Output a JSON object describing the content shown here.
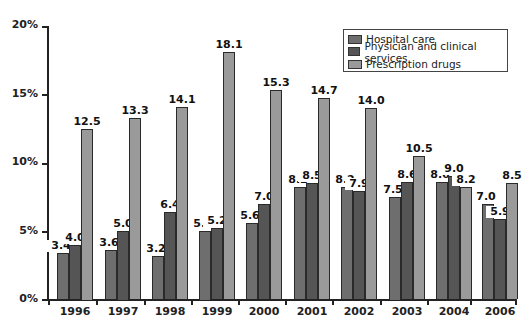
{
  "chart_data": {
    "type": "bar",
    "title": "",
    "xlabel": "",
    "ylabel": "",
    "ylim": [
      0,
      20
    ],
    "yticks": [
      "0%",
      "5%",
      "10%",
      "15%",
      "20%"
    ],
    "grid": false,
    "legend_position": "top-right",
    "categories": [
      "1996",
      "1997",
      "1998",
      "1999",
      "2000",
      "2001",
      "2002",
      "2003",
      "2004",
      "2006"
    ],
    "series": [
      {
        "name": "Hospital care",
        "color": "#6e6e6e",
        "values": [
          3.4,
          3.6,
          3.2,
          5.0,
          5.6,
          8.2,
          8.2,
          7.5,
          8.6,
          7.0
        ]
      },
      {
        "name": "Physician and clinical services",
        "color": "#555555",
        "values": [
          4.0,
          5.0,
          6.4,
          5.2,
          7.0,
          8.5,
          7.9,
          8.6,
          9.0,
          5.9
        ]
      },
      {
        "name": "Prescription drugs",
        "color": "#9a9a9a",
        "values": [
          12.5,
          13.3,
          14.1,
          18.1,
          15.3,
          14.7,
          14.0,
          10.5,
          8.2,
          8.5
        ]
      }
    ],
    "value_labels": [
      [
        "3.4",
        "4.0",
        "12.5"
      ],
      [
        "3.6",
        "5.0",
        "13.3"
      ],
      [
        "3.2",
        "6.4",
        "14.1"
      ],
      [
        "5.0",
        "5.2",
        "18.1"
      ],
      [
        "5.6",
        "7.0",
        "15.3"
      ],
      [
        "8.2",
        "8.5",
        "14.7"
      ],
      [
        "8.2",
        "7.9",
        "14.0"
      ],
      [
        "7.5",
        "8.6",
        "10.5"
      ],
      [
        "8.6",
        "9.0",
        "8.2"
      ],
      [
        "7.0",
        "5.9",
        "8.5"
      ]
    ]
  }
}
